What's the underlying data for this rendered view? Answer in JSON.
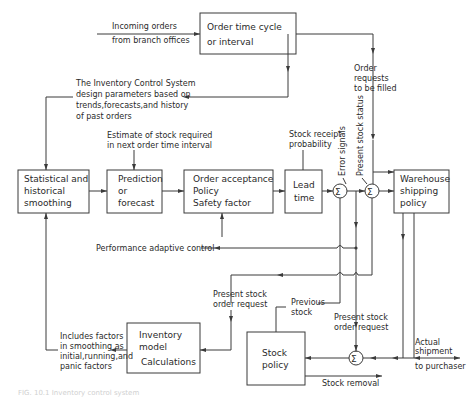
{
  "diagram": {
    "boxes": {
      "order_time_cycle": [
        "Order time cycle",
        "or interval"
      ],
      "statistical": [
        "Statistical and",
        "historical",
        "smoothing"
      ],
      "prediction": [
        "Prediction",
        "or",
        "forecast"
      ],
      "order_acceptance": [
        "Order acceptance",
        "Policy",
        "Safety factor"
      ],
      "lead_time": [
        "Lead",
        "time"
      ],
      "warehouse": [
        "Warehouse",
        "shipping",
        "policy"
      ],
      "inventory_model": [
        "Inventory",
        "model",
        "Calculations"
      ],
      "stock_policy": [
        "Stock",
        "policy"
      ]
    },
    "summing_junction_symbol": "Σ",
    "labels": {
      "incoming_orders": [
        "Incoming orders",
        "from branch offices"
      ],
      "ics_design": [
        "The Inventory Control System",
        "design parameters based on",
        "trends,forecasts,and history",
        "of past orders"
      ],
      "estimate": [
        "Estimate of stock required",
        "in next order time interval"
      ],
      "stock_receipt": [
        "Stock receipt",
        "probability"
      ],
      "error_signals": "Error signals",
      "present_stock_status": "Present stock status",
      "order_requests": [
        "Order",
        "requests",
        "to be filled"
      ],
      "performance": "Performance adaptive control",
      "present_stock_order_left": [
        "Present stock",
        "order request"
      ],
      "previous_stock": [
        "Previous",
        "stock"
      ],
      "present_stock_order_right": [
        "Present stock",
        "order request"
      ],
      "includes_factors": [
        "Includes factors",
        "in smoothing as",
        "initial,running,and",
        "panic factors"
      ],
      "actual_shipment": [
        "Actual",
        "shipment"
      ],
      "to_purchaser": "to purchaser",
      "stock_removal": "Stock removal"
    },
    "caption": "FIG. 10.1  Inventory control system"
  }
}
